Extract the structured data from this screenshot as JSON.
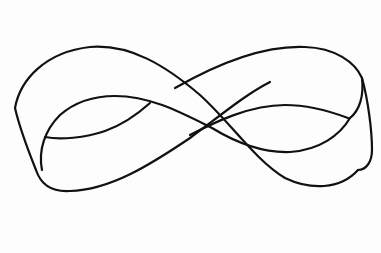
{
  "illustration": {
    "subject": "Möbius strip figure-eight band line drawing",
    "stroke_color": "#111111",
    "background_color": "#fdfdfd",
    "stroke_width": 2.2
  }
}
